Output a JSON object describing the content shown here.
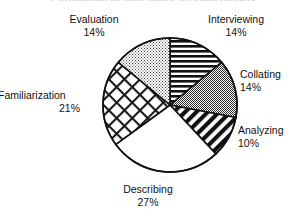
{
  "figure": {
    "title_clipped": "Percentage of time spent on each activity",
    "background": "#ffffff",
    "outline_color": "#111111"
  },
  "chart_data": {
    "type": "pie",
    "title": "",
    "xlabel": "",
    "ylabel": "",
    "units": "percent",
    "start_angle_deg": 0,
    "direction": "clockwise",
    "categories": [
      "Interviewing",
      "Collating",
      "Analyzing",
      "Describing",
      "Familiarization",
      "Evaluation"
    ],
    "values": [
      14,
      14,
      10,
      27,
      21,
      14
    ],
    "labels": [
      {
        "name": "Interviewing",
        "value": 14,
        "value_text": "14%",
        "fill": "horizontal-stripes",
        "position": "top-right"
      },
      {
        "name": "Collating",
        "value": 14,
        "value_text": "14%",
        "fill": "solid-gray",
        "position": "right"
      },
      {
        "name": "Analyzing",
        "value": 10,
        "value_text": "10%",
        "fill": "diagonal-stripes",
        "position": "bottom-right"
      },
      {
        "name": "Describing",
        "value": 27,
        "value_text": "27%",
        "fill": "white",
        "position": "bottom"
      },
      {
        "name": "Familiarization",
        "value": 21,
        "value_text": "21%",
        "fill": "cross-hatch",
        "position": "left"
      },
      {
        "name": "Evaluation",
        "value": 14,
        "value_text": "14%",
        "fill": "light-dots",
        "position": "top-left"
      }
    ],
    "legend": "none",
    "grid": false,
    "total": 100
  },
  "geometry": {
    "center_x": 170,
    "center_y": 105,
    "radius": 67
  },
  "colors": {
    "stroke": "#111111",
    "gray_solid": "#9a9a9a",
    "gray_light": "#d9d9d9",
    "white": "#ffffff"
  }
}
